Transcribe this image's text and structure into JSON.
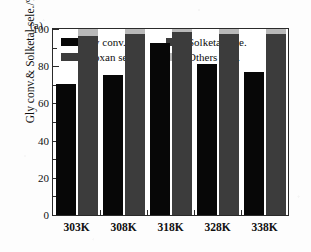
{
  "panel": {
    "label": "(a)"
  },
  "axes": {
    "ylabel": "Gly conv.& Solketal sele./%",
    "xlabel": "",
    "yticks": [
      "0",
      "20",
      "40",
      "60",
      "80",
      "100"
    ],
    "ylim": [
      0,
      100
    ]
  },
  "legend": {
    "items": [
      {
        "label": "Gly conv.",
        "color": "#070707"
      },
      {
        "label": "Solketal sele.",
        "color": "#3c3c3c"
      },
      {
        "label": "Dioxan sele.",
        "color": "#3c3c3c"
      },
      {
        "label": "Others sele.",
        "color": "#b9b9b9"
      }
    ]
  },
  "chart_data": {
    "type": "bar",
    "title": "(a)",
    "xlabel": "",
    "ylabel": "Gly conv.& Solketal sele./%",
    "ylim": [
      0,
      100
    ],
    "grid": false,
    "legend_position": "top-inside",
    "categories": [
      "303K",
      "308K",
      "318K",
      "328K",
      "338K"
    ],
    "series": [
      {
        "name": "Gly conv.",
        "color": "#070707",
        "values": [
          70.5,
          75.5,
          92.5,
          81.0,
          77.0
        ]
      },
      {
        "name": "Solketal sele.",
        "color": "#3c3c3c",
        "values": [
          96.5,
          97.5,
          98.5,
          97.5,
          97.5
        ]
      },
      {
        "name": "Dioxan sele.",
        "color": "#3c3c3c",
        "values": [
          0,
          0,
          0,
          0,
          0
        ]
      },
      {
        "name": "Others sele.",
        "color": "#b9b9b9",
        "values": [
          3.5,
          2.5,
          1.5,
          2.5,
          2.5
        ]
      }
    ],
    "stacked_groups": [
      {
        "name": "selectivity",
        "stack_of": [
          "Solketal sele.",
          "Others sele."
        ]
      }
    ]
  }
}
